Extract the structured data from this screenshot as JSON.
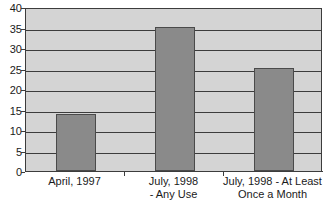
{
  "chart_data": {
    "type": "bar",
    "title": "",
    "subtitle": "",
    "xlabel": "",
    "ylabel": "",
    "categories": [
      "April, 1997",
      "July, 1998 - Any Use",
      "July, 1998 - At Least Once a Month"
    ],
    "category_lines": [
      [
        "April, 1997",
        ""
      ],
      [
        "July, 1998",
        "- Any Use"
      ],
      [
        "July, 1998 - At Least",
        "Once a Month"
      ]
    ],
    "values": [
      14,
      35,
      25
    ],
    "ylim": [
      0,
      40
    ],
    "ytick_step": 5,
    "yticks": [
      0,
      5,
      10,
      15,
      20,
      25,
      30,
      35,
      40
    ],
    "ytick_labels": [
      "0",
      "5",
      "10",
      "15",
      "20",
      "25",
      "30",
      "35",
      "40"
    ],
    "grid": true,
    "legend": false,
    "legend_position": "none",
    "colors": {
      "bar_fill": "#8a8a8a",
      "bar_edge": "#4a4a4a",
      "plot_background": "#d4d4d4",
      "gridline": "#3c3c3c",
      "axis": "#3c3c3c",
      "text": "#1a1a1a",
      "page_background": "#ffffff"
    }
  }
}
